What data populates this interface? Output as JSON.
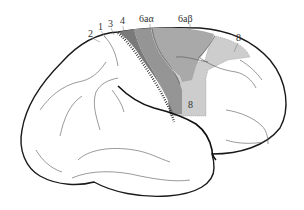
{
  "figure": {
    "type": "brain-lateral-view",
    "labels": [
      {
        "id": "area-2",
        "text": "2",
        "x": 88,
        "y": 37
      },
      {
        "id": "area-1",
        "text": "1",
        "x": 98,
        "y": 30
      },
      {
        "id": "area-3",
        "text": "3",
        "x": 108,
        "y": 27
      },
      {
        "id": "area-4",
        "text": "4",
        "x": 120,
        "y": 24
      },
      {
        "id": "area-6aalpha",
        "text": "6aα",
        "x": 139,
        "y": 22
      },
      {
        "id": "area-6abeta",
        "text": "6aβ",
        "x": 178,
        "y": 22
      },
      {
        "id": "area-8-top",
        "text": "8",
        "x": 236,
        "y": 41
      },
      {
        "id": "area-8-lower",
        "text": "8",
        "x": 188,
        "y": 108
      }
    ],
    "colors": {
      "area_4": "#7a7a7a",
      "area_6aalpha": "#959595",
      "area_6abeta": "#a9a9a9",
      "area_8": "#cdcdcd",
      "outline": "#1a1a1a",
      "sulcus": "#555555",
      "background": "#ffffff"
    }
  }
}
